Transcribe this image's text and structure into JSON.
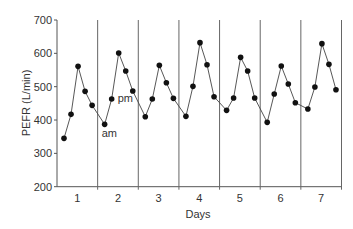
{
  "chart_data": {
    "type": "line",
    "title": "",
    "xlabel": "Days",
    "ylabel": "PEFR (L/min)",
    "ylim": [
      200,
      700
    ],
    "yticks": [
      200,
      300,
      400,
      500,
      600,
      700
    ],
    "ytick_labels": [
      "200",
      "300",
      "400",
      "500",
      "600",
      "700"
    ],
    "categories": [
      "1",
      "2",
      "3",
      "4",
      "5",
      "6",
      "7"
    ],
    "grid": false,
    "legend": "none",
    "readings_per_day": 5,
    "series": [
      {
        "name": "PEFR",
        "values": [
          [
            345,
            417,
            561,
            486,
            444
          ],
          [
            387,
            463,
            601,
            547,
            487
          ],
          [
            410,
            463,
            564,
            512,
            465
          ],
          [
            411,
            501,
            632,
            566,
            470
          ],
          [
            429,
            466,
            588,
            547,
            466
          ],
          [
            393,
            478,
            562,
            508,
            452
          ],
          [
            433,
            499,
            629,
            567,
            491
          ]
        ]
      }
    ],
    "annotations": [
      {
        "text": "am",
        "day": 2,
        "reading": 1,
        "placement": "below"
      },
      {
        "text": "pm",
        "day": 2,
        "reading": 2,
        "placement": "right"
      }
    ]
  }
}
